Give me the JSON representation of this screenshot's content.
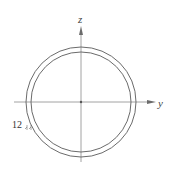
{
  "diagram": {
    "type": "pipe-cross-section",
    "axes": {
      "vertical_label": "z",
      "horizontal_label": "y"
    },
    "dimension": {
      "thickness_label": "12"
    },
    "colors": {
      "stroke": "#6b6b6b",
      "axis": "#8a8a8a",
      "text": "#444444"
    }
  }
}
